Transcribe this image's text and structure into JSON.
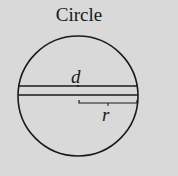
{
  "title": "Circle",
  "labels": {
    "diameter": "d",
    "radius": "r"
  },
  "colors": {
    "background": "#d9d9d9",
    "stroke": "#1a1a1a"
  }
}
